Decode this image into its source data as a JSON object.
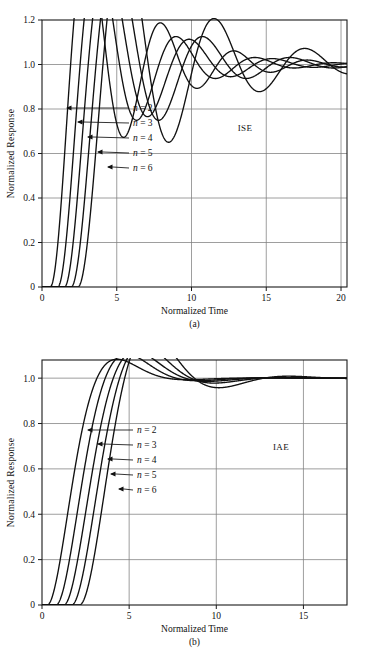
{
  "figure": {
    "panels": [
      {
        "id": "a",
        "caption": "(a)",
        "criterion_label": "ISE",
        "xlabel": "Normalized Time",
        "ylabel": "Normalized  Response",
        "xticks": [
          "0",
          "5",
          "10",
          "15",
          "20"
        ],
        "yticks": [
          "0",
          "0.2",
          "0.4",
          "0.6",
          "0.8",
          "1.0",
          "1.2"
        ],
        "annotations": [
          "n = 2",
          "n = 3",
          "n = 4",
          "n = 5",
          "n = 6"
        ]
      },
      {
        "id": "b",
        "caption": "(b)",
        "criterion_label": "IAE",
        "xlabel": "Normalized Time",
        "ylabel": "Normalized  Response",
        "xticks": [
          "0",
          "5",
          "10",
          "15"
        ],
        "yticks": [
          "0",
          "0.2",
          "0.4",
          "0.6",
          "0.8",
          "1.0"
        ],
        "annotations": [
          "n = 2",
          "n = 3",
          "n = 4",
          "n = 5",
          "n = 6"
        ]
      }
    ]
  },
  "chart_data": [
    {
      "type": "line",
      "title": "ISE",
      "xlabel": "Normalized Time",
      "ylabel": "Normalized Response",
      "xlim": [
        0,
        20.4
      ],
      "ylim": [
        0,
        1.2
      ],
      "xticks": [
        0,
        5,
        10,
        15,
        20
      ],
      "yticks": [
        0,
        0.2,
        0.4,
        0.6,
        0.8,
        1.0,
        1.2
      ],
      "grid": true,
      "legend_position": "inline-annotations",
      "annotations": [
        "n = 2",
        "n = 3",
        "n = 4",
        "n = 5",
        "n = 6",
        "ISE"
      ],
      "series": [
        {
          "name": "n = 2",
          "wn": 1.3,
          "zeta": 0.175,
          "delay": 0.55,
          "overshoot": 1.19,
          "peak_time": 3.4
        },
        {
          "name": "n = 3",
          "wn": 1.22,
          "zeta": 0.215,
          "delay": 1.05,
          "overshoot": 1.085,
          "peak_time": 4.0
        },
        {
          "name": "n = 4",
          "wn": 1.16,
          "zeta": 0.225,
          "delay": 1.5,
          "overshoot": 1.075,
          "peak_time": 4.45
        },
        {
          "name": "n = 5",
          "wn": 1.1,
          "zeta": 0.215,
          "delay": 1.95,
          "overshoot": 1.08,
          "peak_time": 5.0
        },
        {
          "name": "n = 6",
          "wn": 1.05,
          "zeta": 0.165,
          "delay": 2.4,
          "overshoot": 1.085,
          "peak_time": 5.5
        }
      ]
    },
    {
      "type": "line",
      "title": "IAE",
      "xlabel": "Normalized Time",
      "ylabel": "Normalized Response",
      "xlim": [
        0,
        17.5
      ],
      "ylim": [
        0,
        1.08
      ],
      "xticks": [
        0,
        5,
        10,
        15
      ],
      "yticks": [
        0,
        0.2,
        0.4,
        0.6,
        0.8,
        1.0
      ],
      "grid": true,
      "legend_position": "inline-annotations",
      "annotations": [
        "n = 2",
        "n = 3",
        "n = 4",
        "n = 5",
        "n = 6",
        "IAE"
      ],
      "series": [
        {
          "name": "n = 2",
          "wn": 1.0,
          "zeta": 0.62,
          "delay": 0.3,
          "overshoot": 1.045,
          "peak_time": 4.3
        },
        {
          "name": "n = 3",
          "wn": 0.95,
          "zeta": 0.58,
          "delay": 0.8,
          "overshoot": 1.042,
          "peak_time": 4.8
        },
        {
          "name": "n = 4",
          "wn": 0.92,
          "zeta": 0.56,
          "delay": 1.25,
          "overshoot": 1.04,
          "peak_time": 5.3
        },
        {
          "name": "n = 5",
          "wn": 0.9,
          "zeta": 0.52,
          "delay": 1.7,
          "overshoot": 1.045,
          "peak_time": 5.9
        },
        {
          "name": "n = 6",
          "wn": 0.88,
          "zeta": 0.45,
          "delay": 2.15,
          "overshoot": 1.055,
          "peak_time": 7.2
        }
      ]
    }
  ]
}
